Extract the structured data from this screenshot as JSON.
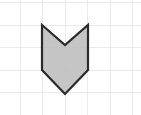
{
  "canvas": {
    "width": 141,
    "height": 115,
    "background_color": "#ffffff",
    "title": "Shaded polygon on graph paper grid"
  },
  "grid": {
    "name": "graph-paper-grid",
    "line_color": "#ebebeb",
    "line_width": 1,
    "cell_width": 22.5,
    "cell_height": 22.5,
    "vertical_lines_x": [
      20,
      42.5,
      65,
      87.5,
      110,
      132.5
    ],
    "horizontal_lines_y": [
      2.5,
      25,
      47.5,
      70,
      92.5,
      115
    ]
  },
  "shape": {
    "name": "chevron-banner-polygon",
    "label": "Shaded arrow-notch polygon",
    "fill_color": "#bdbdbd",
    "fill_opacity": 0.88,
    "stroke_color": "#2b2b2b",
    "stroke_width": 2.2,
    "points": "42,25 65,45 88,25 88,70 65,94 42,70",
    "vertices": [
      {
        "name": "top-left-vertex",
        "x": 42,
        "y": 25
      },
      {
        "name": "top-notch-vertex",
        "x": 65,
        "y": 45
      },
      {
        "name": "top-right-vertex",
        "x": 88,
        "y": 25
      },
      {
        "name": "right-vertex",
        "x": 88,
        "y": 70
      },
      {
        "name": "bottom-point-vertex",
        "x": 65,
        "y": 94
      },
      {
        "name": "left-vertex",
        "x": 42,
        "y": 70
      }
    ],
    "vertex_count": 6,
    "bounding_box": {
      "x": 42,
      "y": 25,
      "width": 46,
      "height": 69
    }
  }
}
